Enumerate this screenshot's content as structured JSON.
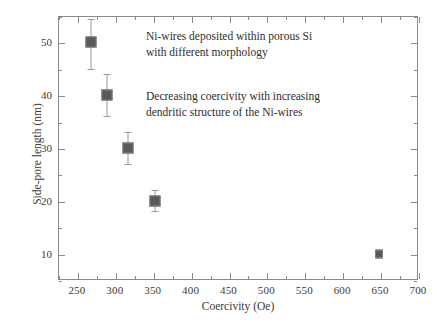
{
  "chart_data": {
    "type": "scatter",
    "title": "",
    "xlabel": "Coercivity (Oe)",
    "ylabel": "Side-pore length (nm)",
    "xlim": [
      225,
      700
    ],
    "ylim": [
      5,
      55
    ],
    "grid": false,
    "legend": "none",
    "x_ticks": [
      250,
      300,
      350,
      400,
      450,
      500,
      550,
      600,
      650,
      700
    ],
    "x_minor_step": 25,
    "y_ticks": [
      10,
      20,
      30,
      40,
      50
    ],
    "y_minor_step": 5,
    "marker_color": "#595959",
    "errorbar_color": "#9a9a9a",
    "axis_color": "#8a8a8a",
    "series": [
      {
        "name": "Ni-wires in porous Si",
        "points": [
          {
            "x": 268,
            "y": 50,
            "yerr_low": 5.0,
            "yerr_high": 4.5
          },
          {
            "x": 289,
            "y": 40,
            "yerr_low": 4.0,
            "yerr_high": 4.0
          },
          {
            "x": 318,
            "y": 30,
            "yerr_low": 3.0,
            "yerr_high": 3.0
          },
          {
            "x": 353,
            "y": 20,
            "yerr_low": 2.0,
            "yerr_high": 2.0
          },
          {
            "x": 648,
            "y": 10,
            "yerr_low": 0.9,
            "yerr_high": 0.9
          }
        ]
      }
    ],
    "annotations": [
      "Ni-wires deposited within porous Si\nwith different morphology",
      "Decreasing coercivity with increasing\ndendritic structure of the Ni-wires"
    ]
  }
}
